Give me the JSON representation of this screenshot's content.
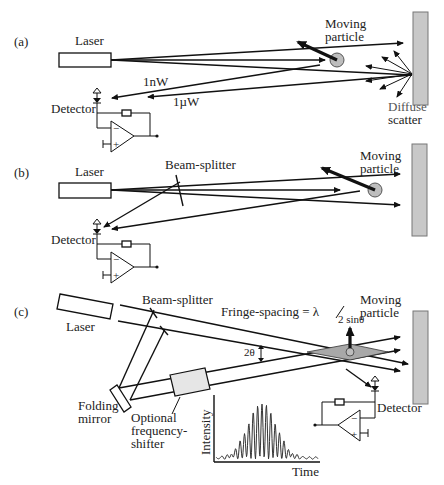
{
  "panels": [
    {
      "id": "a",
      "tag": "(a)",
      "laser_label": "Laser",
      "detector_label": "Detector",
      "particle_label_1": "Moving",
      "particle_label_2": "particle",
      "power_labels": [
        "1nW",
        "1µW"
      ],
      "scatter_label_1": "Diffuse",
      "scatter_label_2": "scatter"
    },
    {
      "id": "b",
      "tag": "(b)",
      "laser_label": "Laser",
      "beam_splitter_label": "Beam-splitter",
      "detector_label": "Detector",
      "particle_label_1": "Moving",
      "particle_label_2": "particle"
    },
    {
      "id": "c",
      "tag": "(c)",
      "laser_label": "Laser",
      "beam_splitter_label": "Beam-splitter",
      "fringe_label": "Fringe-spacing = λ",
      "fringe_denominator": "2 sinθ",
      "angle_label": "2θ",
      "particle_label_1": "Moving",
      "particle_label_2": "particle",
      "mirror_label_1": "Folding",
      "mirror_label_2": "mirror",
      "shifter_label_1": "Optional",
      "shifter_label_2": "frequency-",
      "shifter_label_3": "shifter",
      "detector_label": "Detector",
      "plot_ylabel": "Intensity",
      "plot_xlabel": "Time"
    }
  ],
  "colors": {
    "line": "#111111",
    "wall_fill": "#c8c8c8",
    "particle_fill": "#bdbdbd",
    "fringe_fill": "#a8a8a8"
  }
}
